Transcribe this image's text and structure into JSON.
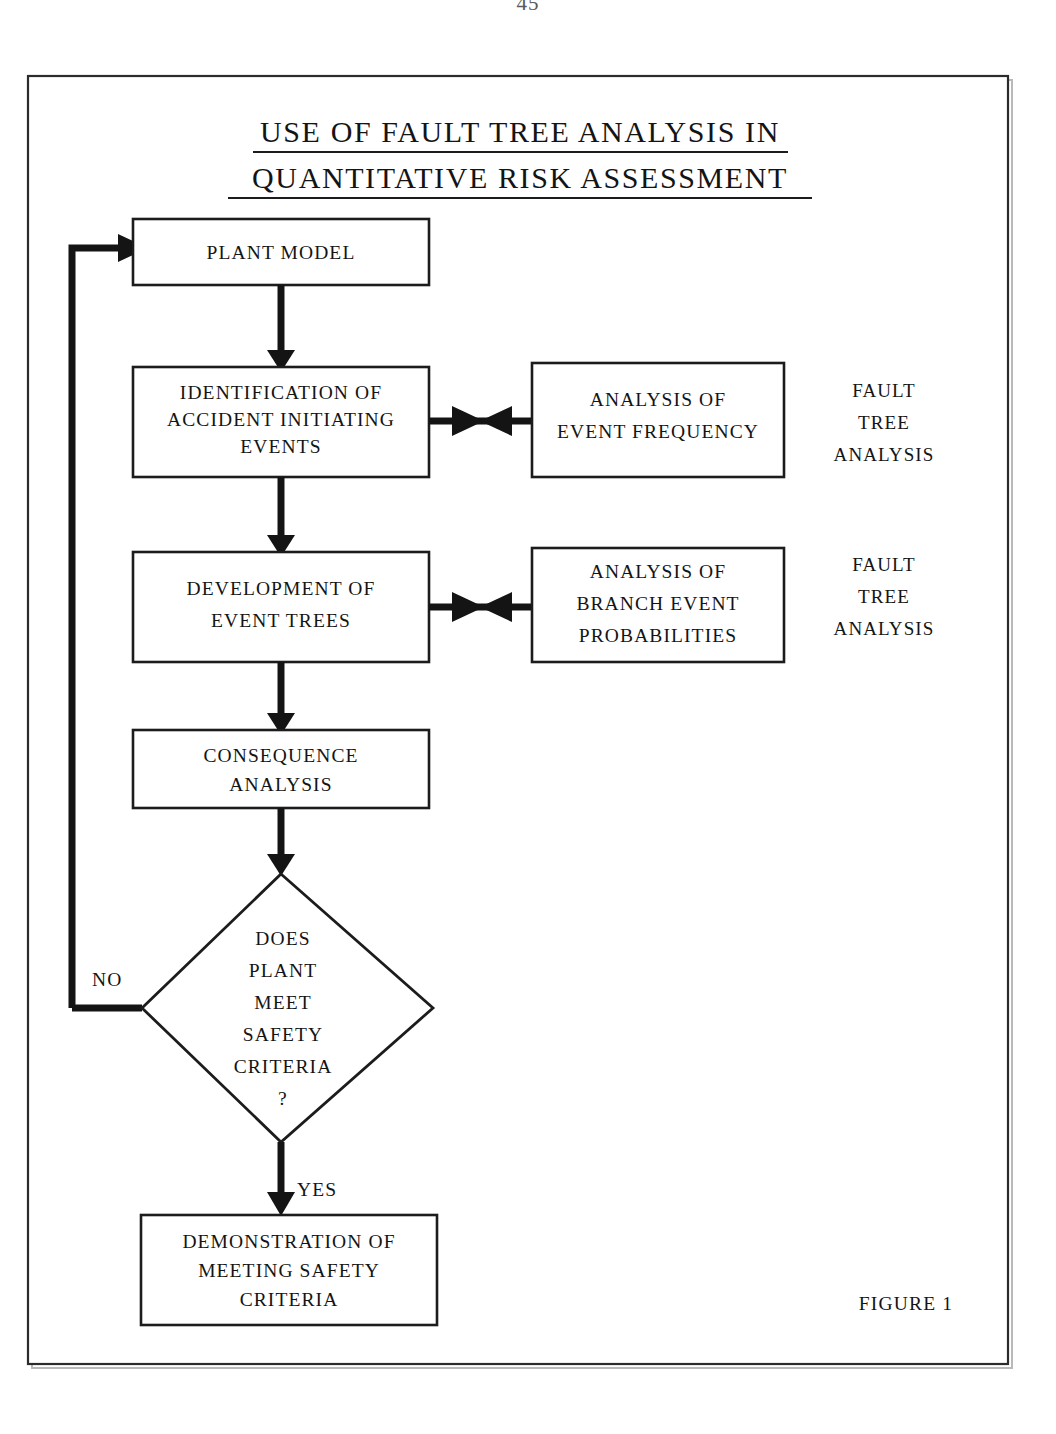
{
  "page": {
    "page_number": "45",
    "figure_caption": "FIGURE 1"
  },
  "title": {
    "line1": "USE OF FAULT TREE ANALYSIS IN",
    "line2": "QUANTITATIVE RISK ASSESSMENT"
  },
  "nodes": {
    "plant_model": {
      "line1": "PLANT MODEL"
    },
    "identification": {
      "line1": "IDENTIFICATION OF",
      "line2": "ACCIDENT INITIATING",
      "line3": "EVENTS"
    },
    "event_frequency": {
      "line1": "ANALYSIS OF",
      "line2": "EVENT FREQUENCY"
    },
    "event_trees": {
      "line1": "DEVELOPMENT OF",
      "line2": "EVENT TREES"
    },
    "branch_probabilities": {
      "line1": "ANALYSIS OF",
      "line2": "BRANCH EVENT",
      "line3": "PROBABILITIES"
    },
    "consequence": {
      "line1": "CONSEQUENCE",
      "line2": "ANALYSIS"
    },
    "decision": {
      "line1": "DOES",
      "line2": "PLANT",
      "line3": "MEET",
      "line4": "SAFETY",
      "line5": "CRITERIA",
      "line6": "?"
    },
    "demonstration": {
      "line1": "DEMONSTRATION OF",
      "line2": "MEETING SAFETY",
      "line3": "CRITERIA"
    }
  },
  "side_labels": {
    "upper": {
      "line1": "FAULT",
      "line2": "TREE",
      "line3": "ANALYSIS"
    },
    "lower": {
      "line1": "FAULT",
      "line2": "TREE",
      "line3": "ANALYSIS"
    }
  },
  "branches": {
    "no_label": "NO",
    "yes_label": "YES"
  },
  "colors": {
    "ink": "#141414",
    "frame": "#2b2b2b",
    "paper": "#ffffff"
  }
}
